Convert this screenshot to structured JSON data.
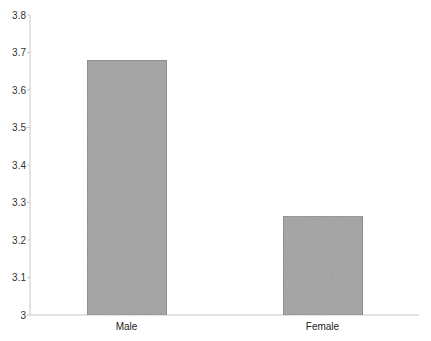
{
  "chart_data": {
    "type": "bar",
    "title": "",
    "xlabel": "",
    "ylabel": "",
    "categories": [
      "Male",
      "Female"
    ],
    "values": [
      3.68,
      3.265
    ],
    "ylim": [
      3,
      3.8
    ],
    "yticks": [
      3,
      3.1,
      3.2,
      3.3,
      3.4,
      3.5,
      3.6,
      3.7,
      3.8
    ],
    "ytick_labels": [
      "3",
      "3.1",
      "3.2",
      "3.3",
      "3.4",
      "3.5",
      "3.6",
      "3.7",
      "3.8"
    ],
    "grid": false,
    "legend": null,
    "colors": {
      "bar_fill": "#a3a3a3",
      "bar_stroke": "#8a8a8a",
      "axis": "#c8c8c8",
      "text": "#333333"
    }
  }
}
